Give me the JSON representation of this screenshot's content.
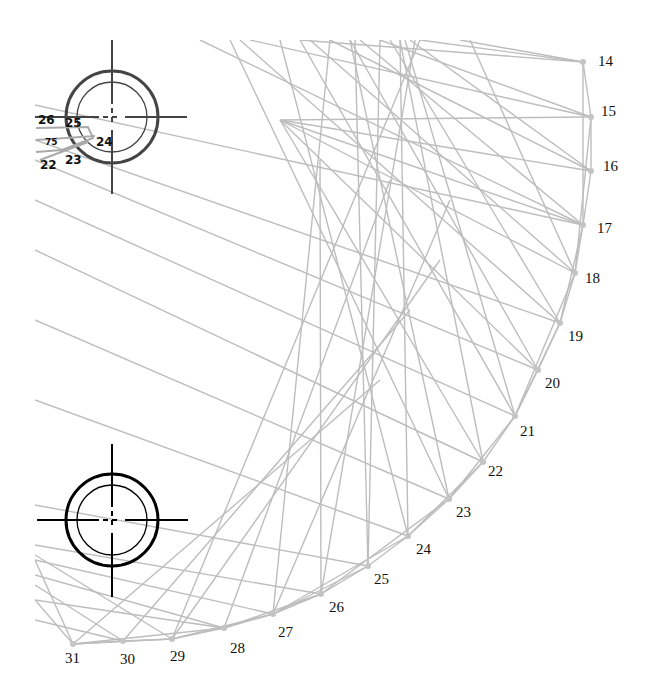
{
  "diagram": {
    "type": "string-art",
    "line_color": "#bdbdbd",
    "node_color": "#c4c4c4",
    "label_color": "#111111",
    "points": [
      {
        "label": "14"
      },
      {
        "label": "15"
      },
      {
        "label": "16"
      },
      {
        "label": "17"
      },
      {
        "label": "18"
      },
      {
        "label": "19"
      },
      {
        "label": "20"
      },
      {
        "label": "21"
      },
      {
        "label": "22"
      },
      {
        "label": "23"
      },
      {
        "label": "24"
      },
      {
        "label": "25"
      },
      {
        "label": "26"
      },
      {
        "label": "27"
      },
      {
        "label": "28"
      },
      {
        "label": "29"
      },
      {
        "label": "30"
      },
      {
        "label": "31"
      }
    ],
    "connections": [
      [
        "14",
        "15"
      ],
      [
        "15",
        "16"
      ],
      [
        "16",
        "17"
      ],
      [
        "17",
        "18"
      ],
      [
        "18",
        "19"
      ],
      [
        "19",
        "20"
      ],
      [
        "20",
        "21"
      ],
      [
        "21",
        "22"
      ],
      [
        "22",
        "23"
      ],
      [
        "23",
        "24"
      ],
      [
        "24",
        "25"
      ],
      [
        "25",
        "26"
      ],
      [
        "26",
        "27"
      ],
      [
        "27",
        "28"
      ],
      [
        "28",
        "29"
      ],
      [
        "29",
        "30"
      ],
      [
        "30",
        "31"
      ],
      [
        "14",
        "17"
      ],
      [
        "15",
        "18"
      ],
      [
        "17",
        "19"
      ],
      [
        "18",
        "21"
      ],
      [
        "19",
        "21"
      ],
      [
        "21",
        "23"
      ],
      [
        "22",
        "24"
      ],
      [
        "23",
        "26"
      ],
      [
        "24",
        "27"
      ],
      [
        "25",
        "27"
      ],
      [
        "26",
        "28"
      ],
      [
        "27",
        "29"
      ],
      [
        "28",
        "31"
      ],
      [
        "29",
        "31"
      ]
    ]
  },
  "targets": [
    {
      "name": "upper-target",
      "color": "#444444"
    },
    {
      "name": "lower-target",
      "color": "#000000"
    }
  ],
  "mini_labels": [
    "26",
    "25",
    "75",
    "24",
    "22",
    "23"
  ]
}
